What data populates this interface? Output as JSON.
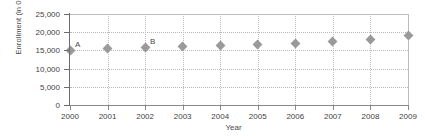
{
  "chart_data": {
    "type": "scatter",
    "title": "",
    "xlabel": "Year",
    "ylabel": "Enrollment (in 000s)",
    "categories": [
      2000,
      2001,
      2002,
      2003,
      2004,
      2005,
      2006,
      2007,
      2008,
      2009
    ],
    "x_tick_labels": [
      "2000",
      "2001",
      "2002",
      "2003",
      "2004",
      "2005",
      "2006",
      "2007",
      "2008",
      "2009"
    ],
    "y_tick_labels": [
      "25,000",
      "20,000",
      "15,000",
      "10,000",
      "5,000",
      "0"
    ],
    "y_ticks": [
      25000,
      20000,
      15000,
      10000,
      5000,
      0
    ],
    "values": [
      15000,
      15400,
      15900,
      16100,
      16400,
      16700,
      17000,
      17400,
      18000,
      19000
    ],
    "ylim": [
      0,
      25000
    ],
    "xlim": [
      2000,
      2009
    ],
    "grid": true,
    "legend": "none",
    "marker": "diamond",
    "marker_color": "#9a9a9a",
    "annotations": [
      {
        "label": "A",
        "x": 2000,
        "y": 15000
      },
      {
        "label": "B",
        "x": 2002,
        "y": 15900
      }
    ]
  }
}
